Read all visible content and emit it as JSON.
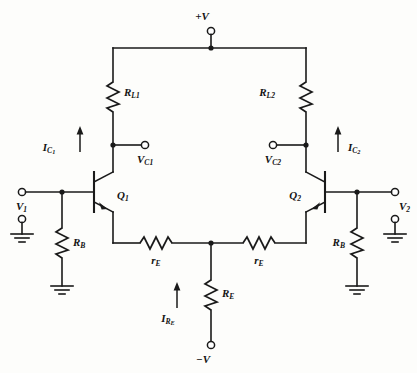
{
  "diagram": {
    "type": "schematic",
    "supply_labels": {
      "positive": "+V",
      "negative": "−V"
    },
    "labels": {
      "rl1": "R",
      "rl1_sub": "L1",
      "rl2": "R",
      "rl2_sub": "L2",
      "rb_left": "R",
      "rb_left_sub": "B",
      "rb_right": "R",
      "rb_right_sub": "B",
      "re_left": "r",
      "re_left_sub": "E",
      "re_right": "r",
      "re_right_sub": "E",
      "RE": "R",
      "RE_sub": "E",
      "q1": "Q",
      "q1_sub": "1",
      "q2": "Q",
      "q2_sub": "2",
      "v1": "V",
      "v1_sub": "1",
      "v2": "V",
      "v2_sub": "2",
      "vc1": "V",
      "vc1_sub": "C1",
      "vc2": "V",
      "vc2_sub": "C2",
      "ic1": "I",
      "ic1_sub": "C",
      "ic1_sub2": "1",
      "ic2": "I",
      "ic2_sub": "C",
      "ic2_sub2": "2",
      "ire": "I",
      "ire_sub": "R",
      "ire_sub2": "E"
    },
    "components": [
      {
        "name": "RL1",
        "kind": "resistor",
        "orientation": "vertical",
        "label": "R_L1"
      },
      {
        "name": "RL2",
        "kind": "resistor",
        "orientation": "vertical",
        "label": "R_L2"
      },
      {
        "name": "RB-left",
        "kind": "resistor",
        "orientation": "vertical",
        "label": "R_B"
      },
      {
        "name": "RB-right",
        "kind": "resistor",
        "orientation": "vertical",
        "label": "R_B"
      },
      {
        "name": "rE-left",
        "kind": "resistor",
        "orientation": "horizontal",
        "label": "r_E"
      },
      {
        "name": "rE-right",
        "kind": "resistor",
        "orientation": "horizontal",
        "label": "r_E"
      },
      {
        "name": "RE",
        "kind": "resistor",
        "orientation": "vertical",
        "label": "R_E"
      },
      {
        "name": "Q1",
        "kind": "npn-transistor",
        "label": "Q_1"
      },
      {
        "name": "Q2",
        "kind": "npn-transistor",
        "label": "Q_2"
      }
    ],
    "terminals": [
      {
        "name": "+V",
        "label": "+V"
      },
      {
        "name": "-V",
        "label": "−V"
      },
      {
        "name": "V1",
        "label": "V_1"
      },
      {
        "name": "V2",
        "label": "V_2"
      },
      {
        "name": "VC1",
        "label": "V_C1"
      },
      {
        "name": "VC2",
        "label": "V_C2"
      }
    ],
    "currents": [
      {
        "name": "IC1",
        "label": "I_C1",
        "direction": "up"
      },
      {
        "name": "IC2",
        "label": "I_C2",
        "direction": "up"
      },
      {
        "name": "IRE",
        "label": "I_RE",
        "direction": "up"
      }
    ],
    "colors": {
      "line": "#1a1a1a",
      "background": "#fdfdfb",
      "text": "#141414"
    }
  }
}
